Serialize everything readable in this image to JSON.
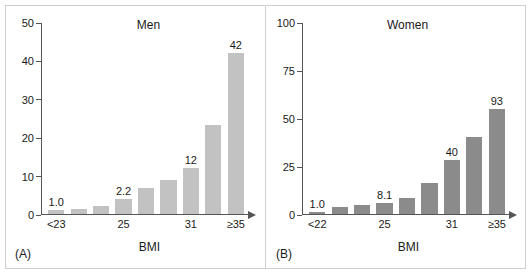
{
  "figure": {
    "background": "#ffffff",
    "border_color": "#cfcfcf"
  },
  "panels": [
    {
      "tag": "(A)",
      "title": "Men",
      "bar_color": "#c2c2c2",
      "xlabel": "BMI"
    },
    {
      "tag": "(B)",
      "title": "Women",
      "bar_color": "#8b8b8b",
      "xlabel": "BMI"
    }
  ],
  "chart_data": [
    {
      "type": "bar",
      "title": "Men",
      "panel": "(A)",
      "xlabel": "BMI",
      "ylabel": "",
      "ylim": [
        0,
        50
      ],
      "yticks": [
        0,
        10,
        20,
        30,
        40,
        50
      ],
      "ytick_labels": [
        "0",
        "10",
        "20",
        "30",
        "40",
        "50"
      ],
      "grid": false,
      "legend": "none",
      "categories": [
        "<23",
        "",
        "",
        "25",
        "",
        "",
        "31",
        "",
        "≥35"
      ],
      "xtick_positions": [
        0,
        3,
        6,
        8
      ],
      "xtick_labels": [
        "<23",
        "25",
        "31",
        "≥35"
      ],
      "values": [
        1.0,
        1.2,
        2.2,
        4.0,
        6.7,
        8.8,
        12,
        23.3,
        42
      ],
      "point_labels": [
        "1.0",
        "",
        "",
        "2.2",
        "",
        "",
        "12",
        "",
        "42"
      ],
      "bar_color": "#c2c2c2"
    },
    {
      "type": "bar",
      "title": "Women",
      "panel": "(B)",
      "xlabel": "BMI",
      "ylabel": "",
      "ylim": [
        0,
        100
      ],
      "yticks": [
        0,
        25,
        50,
        75,
        100
      ],
      "ytick_labels": [
        "0",
        "25",
        "50",
        "75",
        "100"
      ],
      "grid": false,
      "legend": "none",
      "categories": [
        "<22",
        "",
        "",
        "25",
        "",
        "",
        "31",
        "",
        "≥35"
      ],
      "xtick_positions": [
        0,
        3,
        6,
        8
      ],
      "xtick_labels": [
        "<22",
        "25",
        "31",
        "≥35"
      ],
      "values": [
        1.0,
        3.5,
        4.8,
        5.6,
        8.1,
        16.3,
        28.0,
        40,
        54.8,
        93
      ],
      "point_labels": [
        "1.0",
        "",
        "",
        "8.1",
        "",
        "",
        "40",
        "",
        "93"
      ],
      "bar_color": "#8b8b8b"
    }
  ]
}
